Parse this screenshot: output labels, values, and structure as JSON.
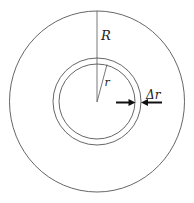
{
  "diagram": {
    "labels": {
      "big_radius": "R",
      "small_radius": "r",
      "thickness": "Δr"
    },
    "colors": {
      "stroke": "#555555",
      "arrow": "#111111",
      "text": "#222222",
      "background": "#ffffff"
    }
  }
}
